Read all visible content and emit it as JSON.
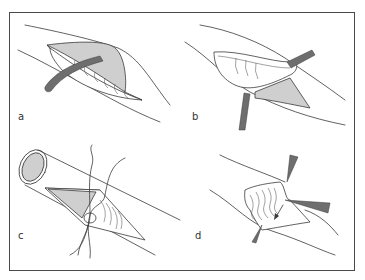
{
  "figure": {
    "panels": [
      {
        "id": "a",
        "label": "a",
        "depiction": "incision with retracted tissue and strap beneath"
      },
      {
        "id": "b",
        "label": "b",
        "depiction": "tissue flap lifted with forceps, strap beneath"
      },
      {
        "id": "c",
        "label": "c",
        "depiction": "tubular structure opened with sutures placed"
      },
      {
        "id": "d",
        "label": "d",
        "depiction": "tissue flap held by three forceps with direction arrow"
      }
    ],
    "colors": {
      "line": "#3a3a3a",
      "tissue_fill": "#cfcfcf",
      "strap_fill": "#6e6e6e",
      "frame": "#4a4a4a",
      "background": "#ffffff"
    }
  }
}
